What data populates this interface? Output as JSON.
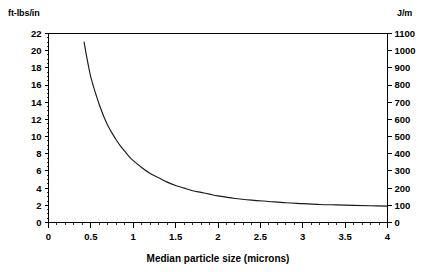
{
  "chart_data": {
    "type": "line",
    "title": "",
    "subtitle": "",
    "xlabel": "Median particle size (microns)",
    "ylabel": "ft-lbs/in",
    "y2label": "J/m",
    "xlim": [
      0,
      4
    ],
    "ylim": [
      0,
      22
    ],
    "y2lim": [
      0,
      1100
    ],
    "grid": false,
    "legend": null,
    "x_ticks": [
      0,
      0.5,
      1,
      1.5,
      2,
      2.5,
      3,
      3.5,
      4
    ],
    "x_tick_labels": [
      "0",
      "0.5",
      "1",
      "1.5",
      "2",
      "2.5",
      "3",
      "3.5",
      "4"
    ],
    "x_minor_tick_step": 0.1,
    "y_ticks": [
      0,
      2,
      4,
      6,
      8,
      10,
      12,
      14,
      16,
      18,
      20,
      22
    ],
    "y_tick_labels": [
      "0",
      "2",
      "4",
      "6",
      "8",
      "10",
      "12",
      "14",
      "16",
      "18",
      "20",
      "22"
    ],
    "y_minor_tick_step": 0.5,
    "y2_ticks": [
      0,
      100,
      200,
      300,
      400,
      500,
      600,
      700,
      800,
      900,
      1000,
      1100
    ],
    "y2_tick_labels": [
      "0",
      "100",
      "200",
      "300",
      "400",
      "500",
      "600",
      "700",
      "800",
      "900",
      "1000",
      "1100"
    ],
    "series": [
      {
        "name": "Izod impact strength vs median particle size",
        "x": [
          0.42,
          0.45,
          0.48,
          0.5,
          0.55,
          0.6,
          0.65,
          0.7,
          0.75,
          0.8,
          0.85,
          0.9,
          0.95,
          1.0,
          1.1,
          1.2,
          1.3,
          1.4,
          1.5,
          1.6,
          1.7,
          1.8,
          1.9,
          2.0,
          2.2,
          2.4,
          2.6,
          2.8,
          3.0,
          3.2,
          3.4,
          3.6,
          3.8,
          4.0
        ],
        "values": [
          21.0,
          19.3,
          17.8,
          16.9,
          15.2,
          13.7,
          12.4,
          11.3,
          10.4,
          9.6,
          8.9,
          8.3,
          7.7,
          7.2,
          6.4,
          5.7,
          5.2,
          4.7,
          4.3,
          4.0,
          3.7,
          3.5,
          3.3,
          3.1,
          2.8,
          2.6,
          2.45,
          2.3,
          2.2,
          2.1,
          2.05,
          2.0,
          1.95,
          1.9
        ],
        "values_y2": [
          1121,
          1031,
          950,
          903,
          812,
          732,
          662,
          603,
          555,
          513,
          475,
          443,
          411,
          384,
          342,
          304,
          278,
          251,
          230,
          214,
          198,
          187,
          176,
          166,
          150,
          139,
          131,
          123,
          117,
          112,
          109,
          107,
          104,
          101
        ]
      }
    ]
  },
  "axis_units": {
    "left": "ft-lbs/in",
    "right": "J/m"
  },
  "colors": {
    "curve": "#1a1a1a",
    "axis": "#000000",
    "background": "#ffffff"
  }
}
